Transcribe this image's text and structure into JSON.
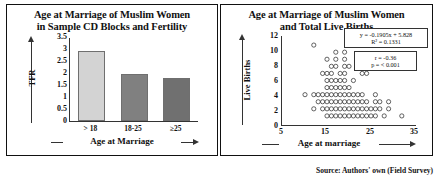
{
  "source_note": "Source: Authors' own (Field Survey)",
  "left_panel": {
    "title_line1": "Age at Marriage of Muslim Women",
    "title_line2": "in Sample CD Blocks and Fertility",
    "ylabel": "TFR",
    "xlabel": "Age at Marriage"
  },
  "right_panel": {
    "title_line1": "Age at Marriage of Muslim Women",
    "title_line2": "and Total Live Births",
    "ylabel": "Live Births",
    "xlabel": "Age at marriage",
    "equation": "y = -0.1905x + 5.828",
    "r_squared": "R² = 0.1331",
    "correlation": "r = -0.36",
    "pvalue": "p = < 0.001"
  },
  "chart_data": [
    {
      "type": "bar",
      "title": "Age at Marriage of Muslim Women in Sample CD Blocks and Fertility",
      "xlabel": "Age at Marriage",
      "ylabel": "TFR",
      "categories": [
        "> 18",
        "18-25",
        "≥25"
      ],
      "values": [
        2.95,
        2.0,
        1.83
      ],
      "ylim": [
        0,
        3.5
      ],
      "yticks": [
        "0",
        "0.5",
        "1",
        "1.5",
        "2",
        "2.5",
        "3",
        "3.5"
      ],
      "bar_colors": [
        "#d3d3d3",
        "#808080",
        "#707070"
      ],
      "grid": false,
      "legend": "none"
    },
    {
      "type": "scatter",
      "title": "Age at Marriage of Muslim Women and Total Live Births",
      "xlabel": "Age at marriage",
      "ylabel": "Live Births",
      "xlim": [
        5,
        35
      ],
      "ylim": [
        0,
        12
      ],
      "xticks": [
        "5",
        "15",
        "25",
        "35"
      ],
      "yticks": [
        "0",
        "2",
        "4",
        "6",
        "8",
        "10",
        "12"
      ],
      "marker": "open-circle",
      "grid": false,
      "legend": "none",
      "annotations": [
        "y = -0.1905x + 5.828",
        "R² = 0.1331",
        "r = -0.36",
        "p = < 0.001"
      ],
      "trendline": {
        "slope": -0.1905,
        "intercept": 5.828,
        "r2": 0.1331
      },
      "points": [
        [
          12,
          11
        ],
        [
          17,
          10
        ],
        [
          19,
          10
        ],
        [
          15,
          9
        ],
        [
          17,
          9
        ],
        [
          19,
          9
        ],
        [
          16,
          8
        ],
        [
          17,
          8
        ],
        [
          19,
          8
        ],
        [
          20,
          8
        ],
        [
          14,
          7
        ],
        [
          15,
          7
        ],
        [
          16,
          7
        ],
        [
          18,
          7
        ],
        [
          19,
          7
        ],
        [
          23,
          7
        ],
        [
          24,
          7
        ],
        [
          15,
          6
        ],
        [
          16,
          6
        ],
        [
          17,
          6
        ],
        [
          18,
          6
        ],
        [
          19,
          6
        ],
        [
          21,
          6
        ],
        [
          15,
          5
        ],
        [
          16,
          5
        ],
        [
          17,
          5
        ],
        [
          18,
          5
        ],
        [
          19,
          5
        ],
        [
          20,
          5
        ],
        [
          10,
          4
        ],
        [
          12,
          4
        ],
        [
          13,
          4
        ],
        [
          14,
          4
        ],
        [
          15,
          4
        ],
        [
          16,
          4
        ],
        [
          17,
          4
        ],
        [
          18,
          4
        ],
        [
          19,
          4
        ],
        [
          20,
          4
        ],
        [
          21,
          4
        ],
        [
          22,
          4
        ],
        [
          23,
          4
        ],
        [
          26,
          4
        ],
        [
          13,
          3
        ],
        [
          14,
          3
        ],
        [
          15,
          3
        ],
        [
          16,
          3
        ],
        [
          17,
          3
        ],
        [
          18,
          3
        ],
        [
          19,
          3
        ],
        [
          20,
          3
        ],
        [
          21,
          3
        ],
        [
          22,
          3
        ],
        [
          23,
          3
        ],
        [
          24,
          3
        ],
        [
          26,
          3
        ],
        [
          27,
          3
        ],
        [
          29,
          3
        ],
        [
          12,
          2
        ],
        [
          14,
          2
        ],
        [
          15,
          2
        ],
        [
          16,
          2
        ],
        [
          17,
          2
        ],
        [
          18,
          2
        ],
        [
          19,
          2
        ],
        [
          20,
          2
        ],
        [
          21,
          2
        ],
        [
          22,
          2
        ],
        [
          23,
          2
        ],
        [
          24,
          2
        ],
        [
          25,
          2
        ],
        [
          26,
          2
        ],
        [
          27,
          2
        ],
        [
          29,
          2
        ],
        [
          15,
          1
        ],
        [
          16,
          1
        ],
        [
          17,
          1
        ],
        [
          18,
          1
        ],
        [
          19,
          1
        ],
        [
          20,
          1
        ],
        [
          21,
          1
        ],
        [
          22,
          1
        ],
        [
          23,
          1
        ],
        [
          24,
          1
        ],
        [
          25,
          1
        ],
        [
          26,
          1
        ],
        [
          28,
          1
        ],
        [
          32,
          1
        ]
      ]
    }
  ]
}
